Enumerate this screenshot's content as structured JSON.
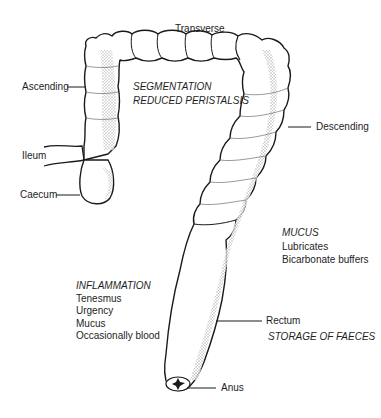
{
  "diagram": {
    "labels": {
      "transverse": "Transverse",
      "ascending": "Ascending",
      "descending": "Descending",
      "ileum": "Ileum",
      "caecum": "Caecum",
      "rectum": "Rectum",
      "anus": "Anus"
    },
    "annotations": {
      "transverse_note": {
        "lines": [
          "SEGMENTATION",
          "REDUCED PERISTALSIS"
        ]
      },
      "mucus": {
        "heading": "MUCUS",
        "items": [
          "Lubricates",
          "Bicarbonate buffers"
        ]
      },
      "inflammation": {
        "heading": "INFLAMMATION",
        "items": [
          "Tenesmus",
          "Urgency",
          "Mucus",
          "Occasionally blood"
        ]
      },
      "rectum_note": "STORAGE OF FAECES"
    },
    "colors": {
      "outline": "#1a1a1a",
      "shading": "#b8b8b8",
      "background": "#ffffff"
    }
  }
}
